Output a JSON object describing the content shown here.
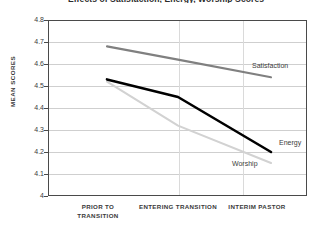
{
  "chart_data": {
    "type": "line",
    "title": "Effects of Satisfaction, Energy, Worship Scores",
    "xlabel": "",
    "ylabel": "MEAN SCORES",
    "categories": [
      "PRIOR TO TRANSITION",
      "ENTERING TRANSITION",
      "INTERIM PASTOR"
    ],
    "ylim": [
      4,
      4.8
    ],
    "ytick_labels": [
      "4.8",
      "4.7",
      "4.6",
      "4.5",
      "4.4",
      "4.3",
      "4.2",
      "4.1",
      "4"
    ],
    "ytick_values": [
      4.8,
      4.7,
      4.6,
      4.5,
      4.4,
      4.3,
      4.2,
      4.1,
      4.0
    ],
    "grid": "horizontal-and-vertical",
    "legend_position": "inline-end-labels",
    "series": [
      {
        "name": "Satisfaction",
        "values": [
          4.68,
          4.62,
          4.54
        ],
        "color": "#808080"
      },
      {
        "name": "Energy",
        "values": [
          4.53,
          4.45,
          4.2
        ],
        "color": "#000000"
      },
      {
        "name": "Worship",
        "values": [
          4.52,
          4.32,
          4.15
        ],
        "color": "#d2d2d2"
      }
    ]
  },
  "axis": {
    "y_title": "MEAN SCORES",
    "x_labels": [
      {
        "line1": "PRIOR TO",
        "line2": "TRANSITION"
      },
      {
        "line1": "ENTERING TRANSITION",
        "line2": ""
      },
      {
        "line1": "INTERIM PASTOR",
        "line2": ""
      }
    ]
  },
  "labels": {
    "satisfaction": "Satisfaction",
    "energy": "Energy",
    "worship": "Worship"
  },
  "colors": {
    "satisfaction": "#808080",
    "energy": "#000000",
    "worship": "#d2d2d2",
    "frame": "#4a4a4a",
    "gridline": "#cfcfcf",
    "background": "#ffffff"
  }
}
